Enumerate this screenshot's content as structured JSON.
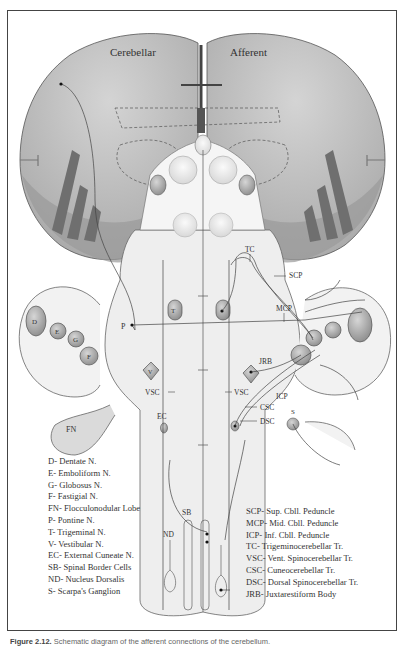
{
  "diagram": {
    "title_left": "Cerebellar",
    "title_right": "Afferent",
    "nuclei_labels": {
      "D": "D",
      "E": "E",
      "G": "G",
      "F": "F",
      "FN": "FN",
      "P": "P",
      "T": "T",
      "V": "V",
      "EC": "EC",
      "SB": "SB",
      "ND": "ND",
      "S": "S"
    },
    "tract_labels": {
      "TC": "TC",
      "SCP": "SCP",
      "MCP": "MCP",
      "JRB": "JRB",
      "ICP": "ICP",
      "VSC_left": "VSC",
      "VSC_right": "VSC",
      "CSC": "CSC",
      "DSC": "DSC"
    },
    "colors": {
      "cerebellum_fill": "#b9b9b9",
      "cerebellum_dark": "#8a8a8a",
      "folia": "#6f6f6f",
      "brainstem_fill": "#ececec",
      "nucleus_fill": "#9d9d9d",
      "outline": "#555555"
    }
  },
  "legend_left": [
    "D- Dentate N.",
    "E- Emboliform N.",
    "G- Globosus N.",
    "F- Fastigial N.",
    "FN- Flocculonodular Lobe",
    "P- Pontine N.",
    "T- Trigeminal N.",
    "V- Vestibular N.",
    "EC- External Cuneate N.",
    "SB- Spinal Border Cells",
    "ND- Nucleus Dorsalis",
    "S- Scarpa's Ganglion"
  ],
  "legend_right": [
    "SCP- Sup. Cbll. Peduncle",
    "MCP- Mid. Cbll. Peduncle",
    "ICP- Inf. Cbll. Peduncle",
    "TC- Trigeminocerebellar Tr.",
    "VSC- Vent. Spinocerebellar Tr.",
    "CSC- Cuneocerebellar Tr.",
    "DSC- Dorsal Spinocerebellar Tr.",
    "JRB- Juxtarestiform Body"
  ],
  "caption": {
    "label": "Figure 2.12.",
    "text": "Schematic diagram of the afferent connections of the cerebellum."
  }
}
